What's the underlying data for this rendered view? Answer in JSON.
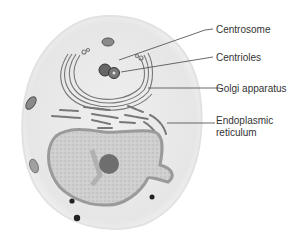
{
  "diagram": {
    "labels": [
      {
        "id": "centrosome",
        "text": "Centrosome"
      },
      {
        "id": "centrioles",
        "text": "Centrioles"
      },
      {
        "id": "golgi",
        "text": "Golgi apparatus"
      },
      {
        "id": "er_line1",
        "text": "Endoplasmic"
      },
      {
        "id": "er_line2",
        "text": "reticulum"
      }
    ]
  },
  "colors": {
    "cytoplasm": "#ececec",
    "nucleus": "#c4c4c4",
    "nucleus_rim": "#9a9a9a",
    "nucleolus": "#6e6e6e",
    "organelle_dark": "#555555",
    "leader_line": "#444444",
    "text": "#333333"
  }
}
